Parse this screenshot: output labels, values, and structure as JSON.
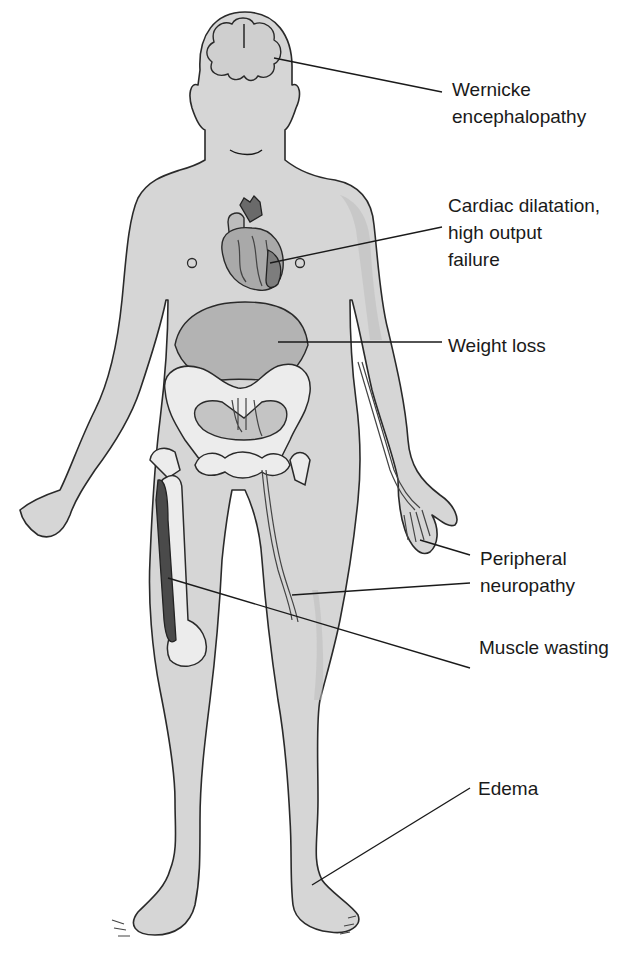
{
  "figure": {
    "colors": {
      "skin": "#d6d6d6",
      "outline": "#2a2a2a",
      "bone": "#ececec",
      "organ": "#a9a9a9",
      "text": "#1a1a1a"
    }
  },
  "labels": [
    {
      "id": "wernicke",
      "lines": [
        "Wernicke",
        "encephalopathy"
      ],
      "target": "brain"
    },
    {
      "id": "cardiac",
      "lines": [
        "Cardiac dilatation,",
        "high output",
        "failure"
      ],
      "target": "heart"
    },
    {
      "id": "weight",
      "lines": [
        "Weight loss"
      ],
      "target": "abdomen"
    },
    {
      "id": "neuropathy",
      "lines": [
        "Peripheral",
        "neuropathy"
      ],
      "target": "hand and thigh nerves"
    },
    {
      "id": "muscle",
      "lines": [
        "Muscle wasting"
      ],
      "target": "thigh muscle"
    },
    {
      "id": "edema",
      "lines": [
        "Edema"
      ],
      "target": "ankle"
    }
  ]
}
